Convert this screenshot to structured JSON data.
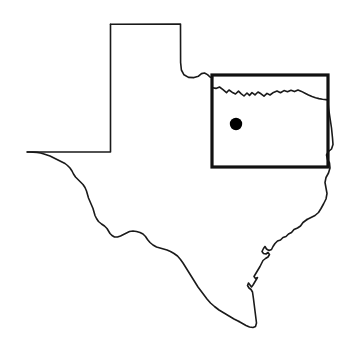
{
  "figure": {
    "kind": "state-outline-map",
    "title": "",
    "caption": "",
    "width": 356,
    "height": 358,
    "background_color": "#ffffff"
  },
  "style": {
    "outline_color": "#1a1a1a",
    "outline_width": 1.6,
    "box_color": "#111111",
    "box_width": 3.2,
    "marker_color": "#000000"
  },
  "layers": {
    "state_outline": {
      "name": "texas-state-outline",
      "stroke": "#1a1a1a",
      "path": "M 110.5 24.2 L 180.5 24.0 L 180.6 62.5 L 181.4 70.0 L 184.0 74.8 L 188.5 77.4 L 194.0 77.6 L 198.5 76.2 L 201.5 73.6 L 204.5 73.0 L 207.5 74.6 L 210.0 77.0 L 212.5 77.8"
    },
    "red_river_border": {
      "name": "red-river-north-border",
      "stroke": "#1a1a1a",
      "path": "M 212.5 87.8 L 216.0 88.4 L 219.5 87.0 L 223.0 89.6 L 226.5 92.6 L 229.0 90.0 L 232.0 92.2 L 235.5 94.0 L 238.5 91.2 L 241.0 93.6 L 244.0 96.0 L 247.0 93.0 L 249.5 95.4 L 252.0 92.6 L 255.0 94.8 L 258.0 92.0 L 261.0 93.8 L 264.0 96.2 L 267.0 93.4 L 270.0 95.0 L 273.5 92.4 L 277.0 91.0 L 280.5 92.8 L 284.0 90.6 L 287.5 91.8 L 291.0 90.2 L 294.5 91.6 L 298.0 90.0 L 301.5 91.4 L 305.0 93.2 L 308.5 95.0 L 312.0 96.6 L 315.5 97.8 L 319.0 98.6 L 322.5 99.2 L 326.0 99.6 L 327.8 100.0"
    },
    "east_border": {
      "name": "sabine-east-border",
      "stroke": "#1a1a1a",
      "path": "M 327.8 100.0 L 328.5 108.0 L 330.0 118.0 L 331.5 128.0 L 332.5 138.0 L 333.0 144.5 L 331.5 149.0 L 328.5 151.5 L 326.5 155.0 L 327.5 159.5 L 329.5 163.0 L 330.0 168.0 L 328.5 173.0 L 326.0 177.5 L 325.0 182.5 L 326.0 188.0 L 327.0 193.5 L 326.0 199.0 L 323.5 204.0 L 321.0 208.5 L 318.5 212.5 L 315.0 215.5 L 311.0 217.5 L 307.0 219.5"
    },
    "gulf_coast": {
      "name": "gulf-coast-border",
      "stroke": "#1a1a1a",
      "path": "M 307.0 219.5 L 303.0 222.5 L 300.5 226.0 L 297.5 228.0 L 294.0 229.5 L 291.5 232.5 L 288.5 234.0 L 286.0 236.5 L 283.0 237.5 L 280.5 240.0 L 277.5 241.0 L 275.0 243.5 L 273.0 246.5 L 271.5 249.5 L 269.0 250.5 L 266.5 249.0 L 265.0 246.5 L 263.5 248.5 L 262.0 251.5 L 263.5 253.5 L 266.0 254.0 L 268.0 252.5 L 269.5 254.5 L 268.0 257.0 L 265.5 258.5 L 263.0 260.5 L 261.5 263.5 L 260.0 266.5 L 258.5 269.0 L 257.0 271.5 L 255.5 274.0 L 254.0 276.5 L 255.5 278.5 L 257.5 277.5 L 256.0 280.0 L 254.5 282.5 L 253.0 285.0 L 251.5 287.0 L 250.0 285.0 L 248.5 283.0 L 247.5 285.5 L 249.0 288.0 L 251.0 289.5 L 252.5 292.0 L 253.0 295.5 L 253.5 299.0 L 254.0 303.0 L 254.5 307.0 L 255.0 311.0 L 255.5 315.0 L 256.0 319.0 L 256.5 323.0 L 255.5 326.5 L 253.0 327.5 L 249.5 327.0 L 246.0 325.5 L 242.5 323.5 L 239.0 321.5"
    },
    "rio_grande": {
      "name": "rio-grande-south-border",
      "stroke": "#1a1a1a",
      "path": "M 239.0 321.5 L 234.0 319.0 L 229.0 316.0 L 224.0 313.0 L 219.0 310.0 L 214.5 306.5 L 210.5 303.0 L 207.0 299.0 L 204.0 295.0 L 201.0 291.0 L 198.0 287.0 L 195.5 283.0 L 193.0 279.0 L 190.5 275.0 L 188.0 271.0 L 185.5 267.0 L 183.0 263.0 L 180.5 259.5 L 177.5 256.0 L 174.0 253.5 L 170.5 251.5 L 167.0 250.0 L 163.5 249.0 L 160.0 248.0 L 156.5 247.0 L 153.0 245.0 L 150.0 242.5 L 147.5 239.5 L 145.5 236.5 L 143.0 234.0 L 140.0 232.5 L 136.5 231.5 L 133.0 231.0 L 129.5 231.5 L 126.5 233.0 L 123.5 234.5 L 120.5 236.0 L 117.5 237.0 L 114.5 237.0 L 112.0 235.5 L 110.0 233.5 L 108.5 231.0 L 107.0 228.5 L 104.5 226.0 L 101.5 224.0 L 98.5 221.5 L 96.5 218.5 L 95.0 215.5 L 94.0 212.0 L 93.0 208.5 L 91.5 205.0 L 90.0 201.5 L 88.5 198.0 L 87.5 194.5 L 86.5 191.0 L 85.0 187.5 L 83.0 184.5 L 80.5 182.0 L 78.0 179.5 L 75.5 177.0 L 73.5 174.0 L 72.0 171.0 L 70.0 168.0 L 67.5 165.5 L 65.0 163.5 L 62.0 162.0 L 59.0 160.5 L 56.0 159.0 L 53.0 157.5 L 50.0 156.0 L 47.0 155.0 L 44.0 154.0 L 40.5 153.0 L 37.0 152.4 L 33.0 152.1 L 29.5 152.0 L 27.2 152.0"
    },
    "west_panhandle_border": {
      "name": "west-and-panhandle-border",
      "stroke": "#1a1a1a",
      "path": "M 27.2 152.0 L 60.0 152.0 L 90.0 152.0 L 110.5 152.0 L 110.5 120.0 L 110.5 80.0 L 110.5 45.0 L 110.5 24.2"
    }
  },
  "overlays": {
    "region_box": {
      "name": "highlighted-region-box",
      "x": 212,
      "y": 75,
      "width": 116,
      "height": 92,
      "stroke": "#111111",
      "stroke_width": 3.2,
      "fill": "none"
    },
    "marker": {
      "name": "site-location-marker",
      "cx": 236,
      "cy": 124,
      "r": 6.2,
      "fill": "#000000",
      "label": ""
    }
  },
  "legend": {
    "visible": false,
    "items": []
  },
  "labels": {
    "visible": false,
    "items": []
  }
}
